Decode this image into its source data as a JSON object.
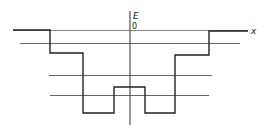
{
  "diagram": {
    "type": "potential-well-energy-diagram",
    "axes": {
      "vertical_label": "E",
      "horizontal_label": "x",
      "origin_label": "0"
    },
    "potential_profile": {
      "description": "Symmetric stepped potential well with a central barrier",
      "points": [
        [
          13,
          30
        ],
        [
          50,
          30
        ],
        [
          50,
          53
        ],
        [
          83,
          53
        ],
        [
          83,
          113
        ],
        [
          114,
          113
        ],
        [
          114,
          87
        ],
        [
          145,
          87
        ],
        [
          145,
          113
        ],
        [
          175,
          113
        ],
        [
          175,
          55
        ],
        [
          209,
          55
        ],
        [
          209,
          31
        ],
        [
          248,
          31
        ]
      ]
    },
    "energy_levels": [
      {
        "y": 43,
        "x1": 20,
        "x2": 240
      },
      {
        "y": 75,
        "x1": 49,
        "x2": 212
      },
      {
        "y": 95,
        "x1": 50,
        "x2": 209
      }
    ],
    "colors": {
      "line": "#222222",
      "level": "#555555",
      "background": "#ffffff"
    }
  }
}
